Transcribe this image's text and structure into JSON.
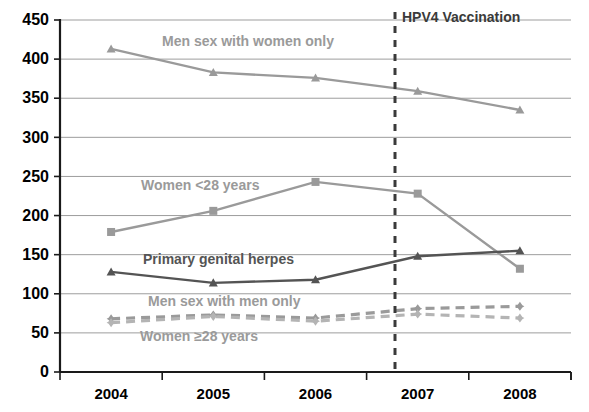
{
  "chart_data": {
    "type": "line",
    "title": "",
    "xlabel": "",
    "ylabel": "",
    "categories": [
      "2004",
      "2005",
      "2006",
      "2007",
      "2008"
    ],
    "ylim": [
      0,
      450
    ],
    "yticks": [
      0,
      50,
      100,
      150,
      200,
      250,
      300,
      350,
      400,
      450
    ],
    "grid": true,
    "legend_position": "inline-labels",
    "series": [
      {
        "name": "Men sex with women only",
        "values": [
          413,
          383,
          376,
          359,
          335
        ],
        "color": "#9a9a9a",
        "marker": "triangle",
        "dash": false,
        "label_x": 162,
        "label_y": 46
      },
      {
        "name": "Women <28 years",
        "values": [
          179,
          206,
          243,
          228,
          132
        ],
        "color": "#9a9a9a",
        "marker": "square",
        "dash": false,
        "label_x": 141,
        "label_y": 190
      },
      {
        "name": "Primary genital herpes",
        "values": [
          128,
          114,
          118,
          148,
          155
        ],
        "color": "#545454",
        "marker": "triangle",
        "dash": false,
        "label_x": 143,
        "label_y": 264
      },
      {
        "name": "Men sex with men only",
        "values": [
          68,
          73,
          69,
          81,
          84
        ],
        "color": "#9a9a9a",
        "marker": "plus",
        "dash": true,
        "label_x": 148,
        "label_y": 306
      },
      {
        "name": "Women ≥28 years",
        "values": [
          63,
          71,
          65,
          74,
          69
        ],
        "color": "#b4b4b4",
        "marker": "plus",
        "dash": true,
        "label_x": 140,
        "label_y": 341
      }
    ],
    "annotations": [
      {
        "text": "HPV4 Vaccination",
        "x": 402,
        "y": 22,
        "vline_x": 395,
        "vline_style": "dashed",
        "vline_color": "#3a3a3a"
      }
    ]
  }
}
